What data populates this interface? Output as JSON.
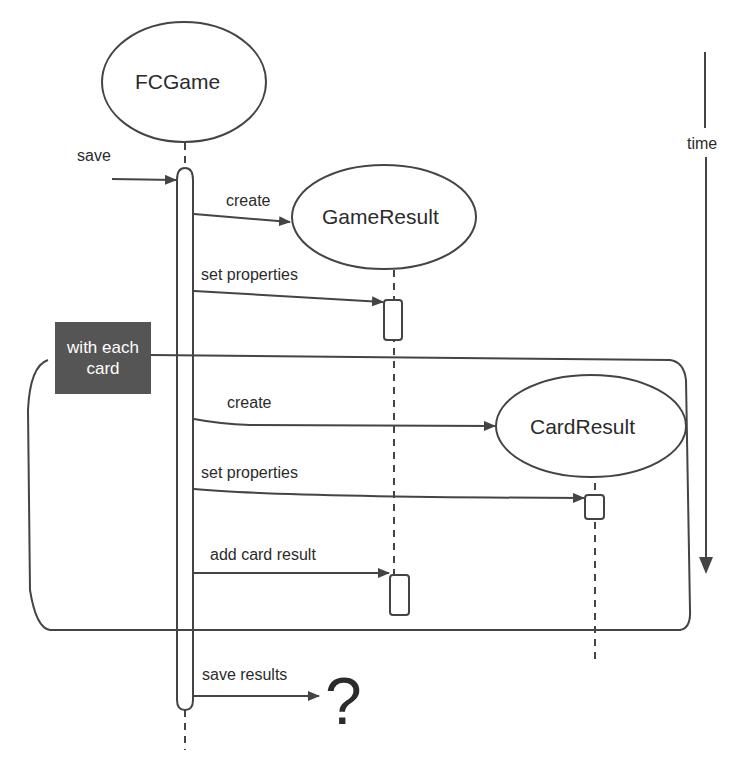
{
  "diagram": {
    "type": "sequence-diagram",
    "colors": {
      "stroke": "#444444",
      "text": "#2b2b2b",
      "loop_tag_bg": "#555555",
      "loop_tag_text": "#ffffff",
      "background": "#ffffff"
    },
    "objects": [
      {
        "id": "fcgame",
        "label": "FCGame"
      },
      {
        "id": "gameresult",
        "label": "GameResult"
      },
      {
        "id": "cardresult",
        "label": "CardResult"
      }
    ],
    "incoming_message": {
      "label": "save"
    },
    "loop": {
      "label": "with each card",
      "label_line1": "with each",
      "label_line2": "card"
    },
    "messages": [
      {
        "label": "create",
        "from": "FCGame",
        "to": "GameResult"
      },
      {
        "label": "set properties",
        "from": "FCGame",
        "to": "GameResult"
      },
      {
        "label": "create",
        "from": "FCGame",
        "to": "CardResult",
        "in_loop": true
      },
      {
        "label": "set properties",
        "from": "FCGame",
        "to": "CardResult",
        "in_loop": true
      },
      {
        "label": "add card result",
        "from": "FCGame",
        "to": "GameResult",
        "in_loop": true
      },
      {
        "label": "save results",
        "from": "FCGame",
        "to": "?"
      }
    ],
    "unknown_target": "?",
    "time_axis": {
      "label": "time"
    }
  }
}
